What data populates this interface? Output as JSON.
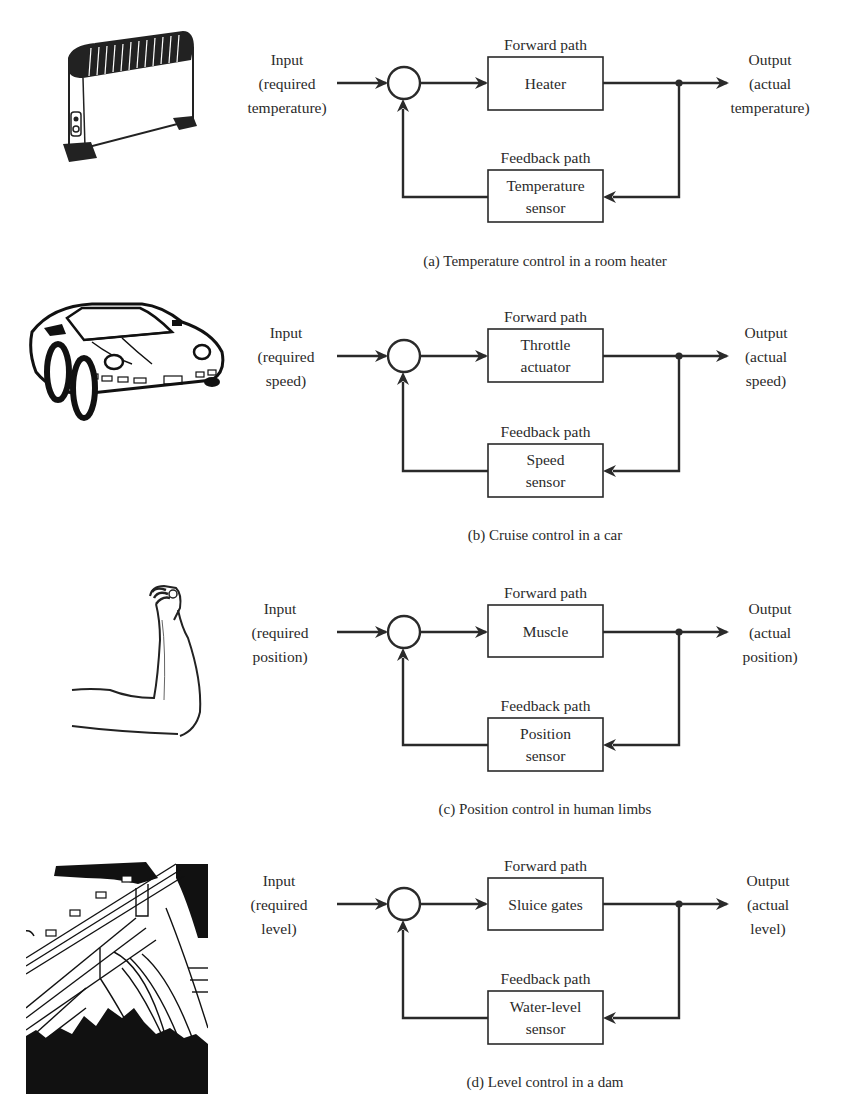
{
  "figure": {
    "stroke_color": "#2a2a2a",
    "background": "#ffffff",
    "panels": [
      {
        "id": "a",
        "illustration": "room-heater",
        "input_lines": [
          "Input",
          "(required",
          "temperature)"
        ],
        "output_lines": [
          "Output",
          "(actual",
          "temperature)"
        ],
        "forward_label": "Forward path",
        "forward_block": [
          "Heater"
        ],
        "feedback_label": "Feedback path",
        "feedback_block": [
          "Temperature",
          "sensor"
        ],
        "caption": "(a) Temperature control in a room heater",
        "geom": {
          "y": 83,
          "fwdTop": 57,
          "fwdBot": 110,
          "fbTop": 170,
          "fbBot": 222,
          "fbY": 197,
          "inX": 287,
          "outX": 770,
          "capY": 261
        }
      },
      {
        "id": "b",
        "illustration": "car",
        "input_lines": [
          "Input",
          "(required",
          "speed)"
        ],
        "output_lines": [
          "Output",
          "(actual",
          "speed)"
        ],
        "forward_label": "Forward path",
        "forward_block": [
          "Throttle",
          "actuator"
        ],
        "feedback_label": "Feedback path",
        "feedback_block": [
          "Speed",
          "sensor"
        ],
        "caption": "(b) Cruise control in a car",
        "geom": {
          "y": 356,
          "fwdTop": 329,
          "fwdBot": 382,
          "fbTop": 444,
          "fbBot": 497,
          "fbY": 471,
          "inX": 286,
          "outX": 766,
          "capY": 535
        }
      },
      {
        "id": "c",
        "illustration": "arm",
        "input_lines": [
          "Input",
          "(required",
          "position)"
        ],
        "output_lines": [
          "Output",
          "(actual",
          "position)"
        ],
        "forward_label": "Forward path",
        "forward_block": [
          "Muscle"
        ],
        "feedback_label": "Feedback path",
        "feedback_block": [
          "Position",
          "sensor"
        ],
        "caption": "(c) Position control in human limbs",
        "geom": {
          "y": 632,
          "fwdTop": 605,
          "fwdBot": 657,
          "fbTop": 718,
          "fbBot": 771,
          "fbY": 745,
          "inX": 280,
          "outX": 770,
          "capY": 809
        }
      },
      {
        "id": "d",
        "illustration": "dam",
        "input_lines": [
          "Input",
          "(required",
          "level)"
        ],
        "output_lines": [
          "Output",
          "(actual",
          "level)"
        ],
        "forward_label": "Forward path",
        "forward_block": [
          "Sluice gates"
        ],
        "feedback_label": "Feedback path",
        "feedback_block": [
          "Water-level",
          "sensor"
        ],
        "caption": "(d) Level control in a dam",
        "geom": {
          "y": 904,
          "fwdTop": 878,
          "fwdBot": 930,
          "fbTop": 991,
          "fbBot": 1044,
          "fbY": 1018,
          "inX": 279,
          "outX": 768,
          "capY": 1082
        }
      }
    ],
    "layout": {
      "inArrowX1": 337,
      "circleX": 404,
      "circleR": 16,
      "boxX1": 488,
      "boxX2": 603,
      "junctionX": 679,
      "outArrowX2": 729
    }
  }
}
